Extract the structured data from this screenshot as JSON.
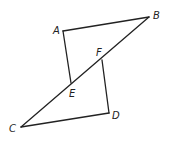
{
  "diagram": {
    "type": "geometry",
    "stroke_color": "#222222",
    "points": {
      "A": {
        "label": "A",
        "x": 63,
        "y": 31,
        "lx": 53,
        "ly": 34
      },
      "B": {
        "label": "B",
        "x": 149,
        "y": 17,
        "lx": 153,
        "ly": 19
      },
      "C": {
        "label": "C",
        "x": 21,
        "y": 127,
        "lx": 9,
        "ly": 132
      },
      "D": {
        "label": "D",
        "x": 109,
        "y": 113,
        "lx": 112,
        "ly": 119
      },
      "E": {
        "label": "E",
        "x": 71,
        "y": 83,
        "lx": 69,
        "ly": 97
      },
      "F": {
        "label": "F",
        "x": 102,
        "y": 60,
        "lx": 96,
        "ly": 56
      }
    },
    "segments": [
      [
        "A",
        "B"
      ],
      [
        "A",
        "E"
      ],
      [
        "B",
        "C"
      ],
      [
        "F",
        "D"
      ],
      [
        "D",
        "C"
      ]
    ]
  }
}
